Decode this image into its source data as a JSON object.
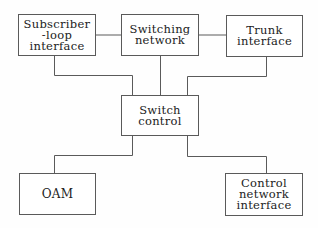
{
  "diagram": {
    "nodes": [
      {
        "id": "subscriber",
        "label": "Subscriber\n-loop\ninterface"
      },
      {
        "id": "switching",
        "label": "Switching\nnetwork"
      },
      {
        "id": "trunk",
        "label": "Trunk\ninterface"
      },
      {
        "id": "switch_control",
        "label": "Switch\ncontrol"
      },
      {
        "id": "oam",
        "label": "OAM"
      },
      {
        "id": "control_network",
        "label": "Control\nnetwork\ninterface"
      }
    ],
    "edges": [
      {
        "from": "subscriber",
        "to": "switching"
      },
      {
        "from": "switching",
        "to": "trunk"
      },
      {
        "from": "subscriber",
        "to": "switch_control"
      },
      {
        "from": "switching",
        "to": "switch_control"
      },
      {
        "from": "trunk",
        "to": "switch_control"
      },
      {
        "from": "switch_control",
        "to": "oam"
      },
      {
        "from": "switch_control",
        "to": "control_network"
      }
    ],
    "line_color": "#5a5a5a"
  }
}
